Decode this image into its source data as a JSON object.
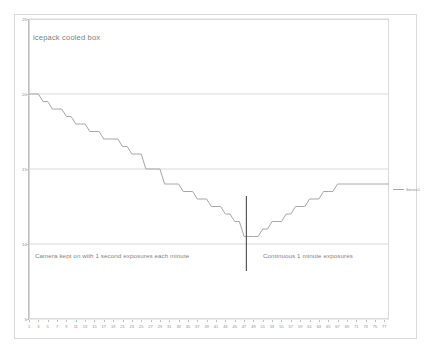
{
  "chart_data": {
    "type": "line",
    "title": "icepack cooled box",
    "xlabel": "",
    "ylabel": "",
    "ylim": [
      5,
      25
    ],
    "xlim": [
      1,
      78
    ],
    "grid": true,
    "y_ticks": [
      25,
      20,
      15,
      10,
      5
    ],
    "x_ticks": [
      1,
      3,
      5,
      7,
      9,
      11,
      13,
      15,
      17,
      19,
      21,
      23,
      25,
      27,
      29,
      31,
      33,
      35,
      37,
      39,
      41,
      43,
      45,
      47,
      49,
      51,
      53,
      55,
      57,
      59,
      61,
      63,
      65,
      67,
      69,
      71,
      73,
      75,
      77
    ],
    "legend": {
      "position": "right",
      "entries": [
        "Series1"
      ]
    },
    "series": [
      {
        "name": "Series1",
        "x": [
          1,
          2,
          3,
          4,
          5,
          6,
          7,
          8,
          9,
          10,
          11,
          12,
          13,
          14,
          15,
          16,
          17,
          18,
          19,
          20,
          21,
          22,
          23,
          24,
          25,
          26,
          27,
          28,
          29,
          30,
          31,
          32,
          33,
          34,
          35,
          36,
          37,
          38,
          39,
          40,
          41,
          42,
          43,
          44,
          45,
          46,
          47,
          48,
          49,
          50,
          51,
          52,
          53,
          54,
          55,
          56,
          57,
          58,
          59,
          60,
          61,
          62,
          63,
          64,
          65,
          66,
          67,
          68,
          69,
          70,
          71,
          72,
          73,
          74,
          75,
          76,
          77,
          78
        ],
        "values": [
          20,
          20,
          20,
          19.5,
          19.5,
          19,
          19,
          19,
          18.5,
          18.5,
          18,
          18,
          18,
          17.5,
          17.5,
          17.5,
          17,
          17,
          17,
          17,
          16.5,
          16.5,
          16,
          16,
          16,
          15,
          15,
          15,
          15,
          14,
          14,
          14,
          14,
          13.5,
          13.5,
          13.5,
          13,
          13,
          13,
          12.5,
          12.5,
          12.5,
          12,
          12,
          11.5,
          11.5,
          10.5,
          10.5,
          10.5,
          10.5,
          11,
          11,
          11.5,
          11.5,
          11.5,
          12,
          12,
          12.5,
          12.5,
          12.5,
          13,
          13,
          13,
          13.5,
          13.5,
          13.5,
          14,
          14,
          14,
          14,
          14,
          14,
          14,
          14,
          14,
          14,
          14,
          14
        ]
      }
    ],
    "annotations": [
      {
        "text": "Camera kept on with 1 second exposures each minute",
        "position": "lower-left"
      },
      {
        "text": "Continuous 1 minute exposures",
        "position": "lower-right"
      },
      {
        "text": "",
        "type": "vertical-divider",
        "x": 47.5
      }
    ]
  },
  "colors": {
    "line": "#a6a6a6",
    "grid": "#d9d9d9",
    "axis": "#bfbfbf",
    "text": "#7f7f7f",
    "divider": "#595959"
  }
}
